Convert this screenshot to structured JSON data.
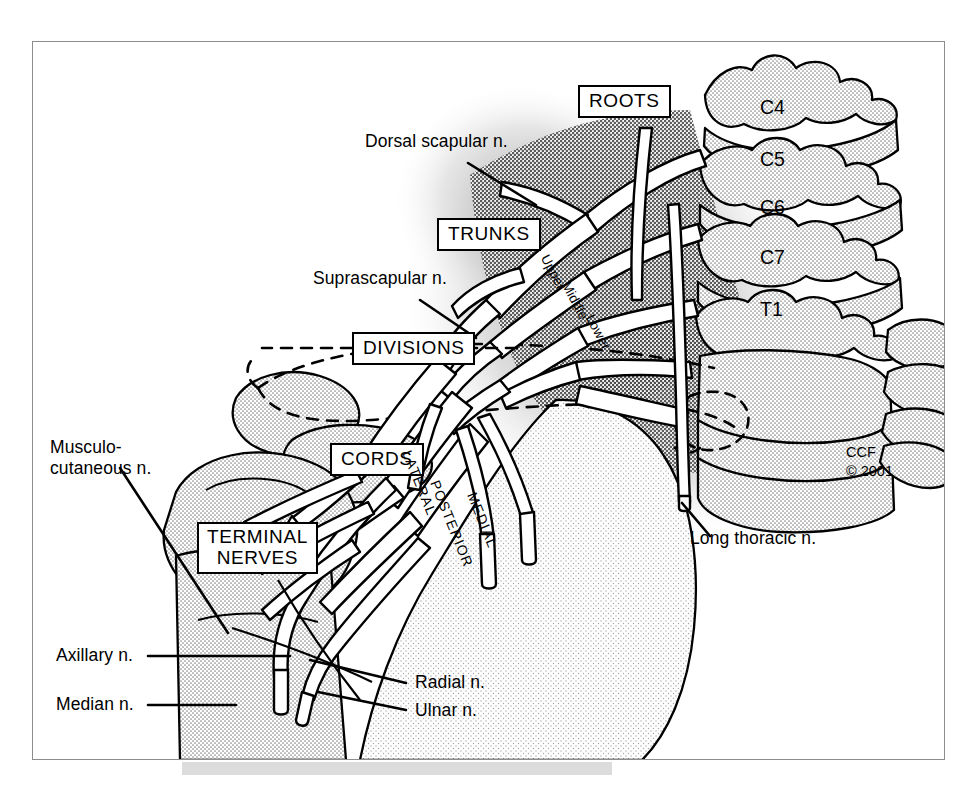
{
  "figure": {
    "copyright": "CCF\n© 2001"
  },
  "category_boxes": [
    {
      "id": "roots",
      "label": "ROOTS"
    },
    {
      "id": "trunks",
      "label": "TRUNKS"
    },
    {
      "id": "divisions",
      "label": "DIVISIONS"
    },
    {
      "id": "cords",
      "label": "CORDS"
    },
    {
      "id": "terminal",
      "label": "TERMINAL\nNERVES",
      "line1": "TERMINAL",
      "line2": "NERVES"
    }
  ],
  "vertebrae": [
    {
      "id": "c4",
      "label": "C4"
    },
    {
      "id": "c5",
      "label": "C5"
    },
    {
      "id": "c6",
      "label": "C6"
    },
    {
      "id": "c7",
      "label": "C7"
    },
    {
      "id": "t1",
      "label": "T1"
    }
  ],
  "trunks": [
    {
      "id": "upper",
      "label": "Upper"
    },
    {
      "id": "middle",
      "label": "Middle"
    },
    {
      "id": "lower",
      "label": "Lower"
    }
  ],
  "cords": [
    {
      "id": "lateral",
      "label": "LATERAL"
    },
    {
      "id": "posterior",
      "label": "POSTERIOR"
    },
    {
      "id": "medial",
      "label": "MEDIAL"
    }
  ],
  "nerve_labels": [
    {
      "id": "dorsal-scapular",
      "label": "Dorsal scapular n."
    },
    {
      "id": "suprascapular",
      "label": "Suprascapular n."
    },
    {
      "id": "long-thoracic",
      "label": "Long thoracic n."
    },
    {
      "id": "musculocutaneous",
      "line1": "Musculo-",
      "line2": "cutaneous n."
    },
    {
      "id": "axillary",
      "label": "Axillary n."
    },
    {
      "id": "median",
      "label": "Median n."
    },
    {
      "id": "radial",
      "label": "Radial n."
    },
    {
      "id": "ulnar",
      "label": "Ulnar n."
    }
  ],
  "colors": {
    "ink": "#000000",
    "bone_fill": "#e3e3e3",
    "muscle_fill": "#d2d2d2",
    "shadow_dark": "#9a9a9a",
    "shadow_mid": "#bdbdbd",
    "frame": "#8d8d8d",
    "plate_shadow": "#dcdcdc",
    "paper": "#ffffff"
  }
}
